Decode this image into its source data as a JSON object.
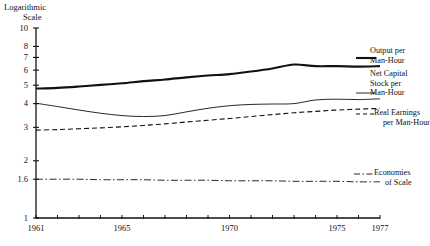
{
  "chart_data": {
    "type": "line",
    "title": "Logarithmic Scale",
    "title_line1": "Logarithmic",
    "title_line2": "Scale",
    "xlabel": "",
    "ylabel": "Logarithmic Scale",
    "scale": "log",
    "xlim": [
      1961,
      1977
    ],
    "ylim": [
      1,
      10
    ],
    "grid": false,
    "legend_position": "right-inline",
    "y_ticks": [
      10,
      8,
      7,
      6,
      5,
      4,
      3,
      2,
      1.6,
      1
    ],
    "y_tick_labels": [
      "10",
      "8",
      "7",
      "6",
      "5",
      "4",
      "3",
      "2",
      "1.6",
      "1"
    ],
    "x_ticks": [
      1961,
      1962,
      1963,
      1964,
      1965,
      1966,
      1967,
      1968,
      1969,
      1970,
      1971,
      1972,
      1973,
      1974,
      1975,
      1976,
      1977
    ],
    "x_tick_labels_shown": [
      "1961",
      "1965",
      "1970",
      "1975",
      "1977"
    ],
    "x_tick_label_years": [
      1961,
      1965,
      1970,
      1975,
      1977
    ],
    "x": [
      1961,
      1962,
      1963,
      1964,
      1965,
      1966,
      1967,
      1968,
      1969,
      1970,
      1971,
      1972,
      1973,
      1974,
      1975,
      1976,
      1977
    ],
    "series": [
      {
        "name": "Output per Man-Hour",
        "label_line1": "Output per",
        "label_line2": "Man-Hour",
        "style": "thick-solid",
        "color": "#111111",
        "width": 2.1,
        "values": [
          4.8,
          4.84,
          4.92,
          5.02,
          5.12,
          5.25,
          5.36,
          5.5,
          5.62,
          5.72,
          5.9,
          6.12,
          6.42,
          6.3,
          6.3,
          6.26,
          6.3
        ]
      },
      {
        "name": "Net Capital Stock per Man-Hour",
        "label_line1": "Net Capital",
        "label_line2": "Stock per",
        "label_line3": "Man-Hour",
        "style": "thin-solid",
        "color": "#111111",
        "width": 0.9,
        "values": [
          4.02,
          3.86,
          3.7,
          3.56,
          3.46,
          3.42,
          3.46,
          3.62,
          3.78,
          3.9,
          3.96,
          3.98,
          4.0,
          4.18,
          4.22,
          4.2,
          4.24
        ]
      },
      {
        "name": "Real Earnings per Man-Hour",
        "label_line1": "Real Earnings",
        "label_line2": "per Man-Hour",
        "style": "dashed",
        "color": "#111111",
        "width": 1.1,
        "values": [
          2.9,
          2.92,
          2.95,
          2.98,
          3.02,
          3.07,
          3.13,
          3.2,
          3.27,
          3.34,
          3.42,
          3.5,
          3.58,
          3.64,
          3.7,
          3.74,
          3.78
        ]
      },
      {
        "name": "Economies of Scale",
        "label_line1": "Economies",
        "label_line2": "of Scale",
        "style": "dash-dot",
        "color": "#111111",
        "width": 0.9,
        "values": [
          1.6,
          1.6,
          1.6,
          1.59,
          1.59,
          1.59,
          1.58,
          1.58,
          1.58,
          1.57,
          1.57,
          1.57,
          1.56,
          1.56,
          1.56,
          1.55,
          1.55
        ]
      }
    ]
  }
}
